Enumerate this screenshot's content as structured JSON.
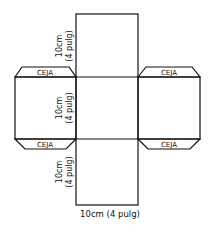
{
  "diagram": {
    "flaps": [
      {
        "label": "CEJA",
        "position": "top-left"
      },
      {
        "label": "CEJA",
        "position": "top-right"
      },
      {
        "label": "CEJA",
        "position": "bottom-left"
      },
      {
        "label": "CEJA",
        "position": "bottom-right"
      }
    ],
    "dimensions": {
      "top_square_side": {
        "line1": "10cm",
        "line2": "(4 pulg)"
      },
      "middle_square_side": {
        "line1": "10cm",
        "line2": "(4 pulg)"
      },
      "bottom_square_side": {
        "line1": "10cm",
        "line2": "(4 pulg)"
      },
      "bottom_width": "10cm (4 pulg)"
    },
    "colors": {
      "line": "#111111",
      "background": "#ffffff"
    }
  }
}
